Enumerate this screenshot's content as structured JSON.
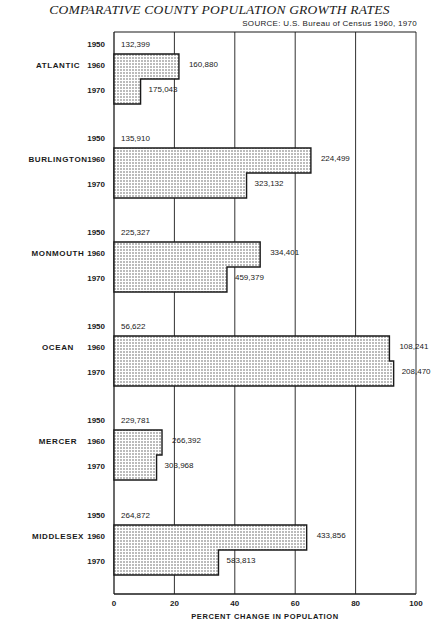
{
  "header": {
    "title": "COMPARATIVE COUNTY POPULATION GROWTH RATES",
    "source": "SOURCE: U.S. Bureau of Census  1960, 1970"
  },
  "axis": {
    "xlabel": "PERCENT CHANGE IN POPULATION",
    "ticks": [
      "0",
      "20",
      "40",
      "60",
      "80",
      "100"
    ]
  },
  "colors": {
    "ink": "#1a1a1a",
    "paper": "#ffffff",
    "stipple": "#6a6a6a"
  },
  "chart_data": {
    "type": "bar",
    "orientation": "horizontal",
    "title": "COMPARATIVE COUNTY POPULATION GROWTH RATES",
    "subtitle": "SOURCE: U.S. Bureau of Census 1960, 1970",
    "xlabel": "PERCENT CHANGE IN POPULATION",
    "ylabel": "",
    "xlim": [
      0,
      100
    ],
    "xticks": [
      0,
      20,
      40,
      60,
      80,
      100
    ],
    "grid": true,
    "legend": null,
    "categories": [
      "ATLANTIC",
      "BURLINGTON",
      "MONMOUTH",
      "OCEAN",
      "MERCER",
      "MIDDLESEX"
    ],
    "series": [
      {
        "name": "1950-1960 % change",
        "values": [
          21.5,
          65.2,
          48.4,
          91.2,
          15.9,
          63.8
        ]
      },
      {
        "name": "1960-1970 % change",
        "values": [
          8.8,
          43.9,
          37.4,
          92.6,
          14.1,
          34.6
        ]
      }
    ],
    "population": {
      "ATLANTIC": {
        "1950": "132,399",
        "1960": "160,880",
        "1970": "175,043"
      },
      "BURLINGTON": {
        "1950": "135,910",
        "1960": "224,499",
        "1970": "323,132"
      },
      "MONMOUTH": {
        "1950": "225,327",
        "1960": "334,401",
        "1970": "459,379"
      },
      "OCEAN": {
        "1950": "56,622",
        "1960": "108,241",
        "1970": "208,470"
      },
      "MERCER": {
        "1950": "229,781",
        "1960": "266,392",
        "1970": "303,968"
      },
      "MIDDLESEX": {
        "1950": "264,872",
        "1960": "433,856",
        "1970": "583,813"
      }
    }
  },
  "counties": [
    {
      "name": "ATLANTIC",
      "years": [
        "1950",
        "1960",
        "1970"
      ],
      "pops": [
        "132,399",
        "160,880",
        "175,043"
      ],
      "pct60": 21.5,
      "pct70": 8.8
    },
    {
      "name": "BURLINGTON",
      "years": [
        "1950",
        "1960",
        "1970"
      ],
      "pops": [
        "135,910",
        "224,499",
        "323,132"
      ],
      "pct60": 65.2,
      "pct70": 43.9
    },
    {
      "name": "MONMOUTH",
      "years": [
        "1950",
        "1960",
        "1970"
      ],
      "pops": [
        "225,327",
        "334,401",
        "459,379"
      ],
      "pct60": 48.4,
      "pct70": 37.4
    },
    {
      "name": "OCEAN",
      "years": [
        "1950",
        "1960",
        "1970"
      ],
      "pops": [
        "56,622",
        "108,241",
        "208,470"
      ],
      "pct60": 91.2,
      "pct70": 92.6
    },
    {
      "name": "MERCER",
      "years": [
        "1950",
        "1960",
        "1970"
      ],
      "pops": [
        "229,781",
        "266,392",
        "303,968"
      ],
      "pct60": 15.9,
      "pct70": 14.1
    },
    {
      "name": "MIDDLESEX",
      "years": [
        "1950",
        "1960",
        "1970"
      ],
      "pops": [
        "264,872",
        "433,856",
        "583,813"
      ],
      "pct60": 63.8,
      "pct70": 34.6
    }
  ]
}
